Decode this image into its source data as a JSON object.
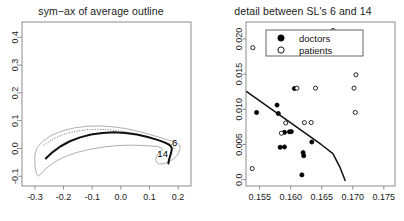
{
  "figure": {
    "background": "#ffffff",
    "panels": 2
  },
  "left_panel": {
    "title": "sym−ax of average outline",
    "axis_color": "#808080",
    "chart_data": {
      "type": "line",
      "title": "sym−ax of average outline",
      "xlabel": "",
      "ylabel": "",
      "xlim": [
        -0.345,
        0.245
      ],
      "ylim": [
        -0.135,
        0.455
      ],
      "xticks": [
        -0.3,
        -0.2,
        -0.1,
        0.0,
        0.1,
        0.2
      ],
      "xticklabels": [
        "-0.3",
        "-0.2",
        "-0.1",
        "0.0",
        "0.1",
        "0.2"
      ],
      "yticks": [
        -0.1,
        0.0,
        0.1,
        0.2,
        0.3,
        0.4
      ],
      "yticklabels": [
        "-0.1",
        "0.0",
        "0.1",
        "0.2",
        "0.3",
        "0.4"
      ],
      "grid": false,
      "series": [
        {
          "name": "outer outline",
          "style": "thin-solid",
          "color": "#999999",
          "points": [
            [
              -0.3,
              -0.022
            ],
            [
              -0.292,
              0.004
            ],
            [
              -0.272,
              0.026
            ],
            [
              -0.243,
              0.047
            ],
            [
              -0.205,
              0.063
            ],
            [
              -0.162,
              0.074
            ],
            [
              -0.118,
              0.08
            ],
            [
              -0.072,
              0.081
            ],
            [
              -0.028,
              0.078
            ],
            [
              0.014,
              0.072
            ],
            [
              0.056,
              0.063
            ],
            [
              0.096,
              0.052
            ],
            [
              0.132,
              0.041
            ],
            [
              0.16,
              0.032
            ],
            [
              0.181,
              0.026
            ],
            [
              0.196,
              0.021
            ],
            [
              0.205,
              0.012
            ],
            [
              0.207,
              0.0
            ],
            [
              0.202,
              -0.016
            ],
            [
              0.19,
              -0.033
            ],
            [
              0.172,
              -0.046
            ],
            [
              0.152,
              -0.054
            ],
            [
              0.136,
              -0.056
            ],
            [
              0.126,
              -0.05
            ],
            [
              0.122,
              -0.04
            ],
            [
              0.124,
              -0.028
            ],
            [
              0.131,
              -0.018
            ],
            [
              0.14,
              -0.011
            ],
            [
              0.145,
              -0.004
            ],
            [
              0.142,
              0.003
            ],
            [
              0.128,
              0.007
            ],
            [
              0.104,
              0.009
            ],
            [
              0.07,
              0.011
            ],
            [
              0.028,
              0.012
            ],
            [
              -0.016,
              0.01
            ],
            [
              -0.062,
              0.005
            ],
            [
              -0.108,
              -0.003
            ],
            [
              -0.152,
              -0.014
            ],
            [
              -0.192,
              -0.028
            ],
            [
              -0.224,
              -0.044
            ],
            [
              -0.25,
              -0.063
            ],
            [
              -0.272,
              -0.083
            ],
            [
              -0.288,
              -0.1
            ],
            [
              -0.295,
              -0.09
            ],
            [
              -0.3,
              -0.062
            ],
            [
              -0.3,
              -0.022
            ]
          ]
        },
        {
          "name": "dotted outline",
          "style": "dotted",
          "color": "#555555",
          "points": [
            [
              -0.27,
              0.012
            ],
            [
              -0.238,
              0.033
            ],
            [
              -0.2,
              0.051
            ],
            [
              -0.158,
              0.062
            ],
            [
              -0.114,
              0.068
            ],
            [
              -0.07,
              0.069
            ],
            [
              -0.026,
              0.066
            ],
            [
              0.016,
              0.06
            ],
            [
              0.058,
              0.051
            ],
            [
              0.098,
              0.04
            ],
            [
              0.132,
              0.03
            ],
            [
              0.158,
              0.022
            ],
            [
              0.176,
              0.015
            ],
            [
              0.186,
              0.007
            ],
            [
              0.186,
              -0.002
            ]
          ]
        },
        {
          "name": "symmetry axis",
          "style": "thick-solid",
          "color": "#111111",
          "points": [
            [
              -0.262,
              -0.036
            ],
            [
              -0.238,
              -0.013
            ],
            [
              -0.21,
              0.008
            ],
            [
              -0.178,
              0.026
            ],
            [
              -0.142,
              0.04
            ],
            [
              -0.104,
              0.05
            ],
            [
              -0.064,
              0.056
            ],
            [
              -0.024,
              0.058
            ],
            [
              0.016,
              0.056
            ],
            [
              0.056,
              0.05
            ],
            [
              0.094,
              0.041
            ],
            [
              0.128,
              0.031
            ],
            [
              0.152,
              0.022
            ],
            [
              0.168,
              0.014
            ],
            [
              0.176,
              0.006
            ],
            [
              0.178,
              -0.002
            ],
            [
              0.176,
              -0.014
            ],
            [
              0.172,
              -0.028
            ],
            [
              0.168,
              -0.042
            ],
            [
              0.166,
              -0.054
            ]
          ]
        }
      ],
      "annotations": [
        {
          "text": "6",
          "x": 0.188,
          "y": 0.02
        },
        {
          "text": "14",
          "x": 0.146,
          "y": -0.018
        }
      ]
    }
  },
  "right_panel": {
    "title": "detail between SL's 6 and 14",
    "axis_color": "#808080",
    "legend": {
      "entries": [
        {
          "label": "doctors",
          "marker": "filled-circle"
        },
        {
          "label": "patients",
          "marker": "open-circle"
        }
      ]
    },
    "chart_data": {
      "type": "scatter",
      "title": "detail between SL's 6 and 14",
      "xlabel": "",
      "ylabel": "",
      "xlim": [
        0.1528,
        0.1768
      ],
      "ylim": [
        -0.0009,
        0.0224
      ],
      "xticks": [
        0.155,
        0.16,
        0.165,
        0.17,
        0.175
      ],
      "xticklabels": [
        "0.155",
        "0.160",
        "0.165",
        "0.170",
        "0.175"
      ],
      "yticks": [
        0.0,
        0.005,
        0.01,
        0.015,
        0.02
      ],
      "yticklabels": [
        "0.0",
        "0.005",
        "0.010",
        "0.015",
        "0.020"
      ],
      "grid": false,
      "legend_position": "top-center",
      "series": [
        {
          "name": "doctors",
          "marker": "filled-circle",
          "color": "#000000",
          "points": [
            [
              0.1545,
              0.00955
            ],
            [
              0.1578,
              0.0106
            ],
            [
              0.158,
              0.0094
            ],
            [
              0.1583,
              0.0046
            ],
            [
              0.159,
              0.00465
            ],
            [
              0.159,
              0.00672
            ],
            [
              0.1598,
              0.0068
            ],
            [
              0.1606,
              0.01295
            ],
            [
              0.1601,
              0.00683
            ],
            [
              0.162,
              0.00384
            ],
            [
              0.1621,
              0.0034
            ],
            [
              0.1618,
              0.00068
            ],
            [
              0.1634,
              0.00535
            ]
          ]
        },
        {
          "name": "patients",
          "marker": "open-circle",
          "color": "#000000",
          "points": [
            [
              0.1539,
              0.01875
            ],
            [
              0.1538,
              0.00158
            ],
            [
              0.1585,
              0.0066
            ],
            [
              0.1592,
              0.00805
            ],
            [
              0.161,
              0.013
            ],
            [
              0.1622,
              0.0081
            ],
            [
              0.1633,
              0.00812
            ],
            [
              0.164,
              0.013
            ],
            [
              0.1668,
              0.0212
            ],
            [
              0.1702,
              0.013
            ],
            [
              0.1705,
              0.0149
            ],
            [
              0.1704,
              0.00955
            ]
          ]
        },
        {
          "name": "fitted line",
          "marker": "none",
          "style": "solid",
          "color": "#111111",
          "points": [
            [
              0.15285,
              0.01255
            ],
            [
              0.1649,
              0.005
            ],
            [
              0.1668,
              0.0037
            ],
            [
              0.1679,
              0.00182
            ],
            [
              0.1688,
              -0.0002
            ]
          ]
        }
      ]
    }
  }
}
